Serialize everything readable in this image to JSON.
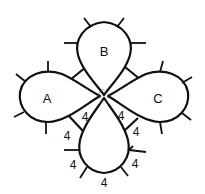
{
  "diagram": {
    "type": "tatting-pattern",
    "rings": [
      {
        "id": "A",
        "label": "A",
        "position": "left"
      },
      {
        "id": "B",
        "label": "B",
        "position": "top"
      },
      {
        "id": "C",
        "label": "C",
        "position": "right"
      },
      {
        "id": "D",
        "label": "",
        "position": "bottom"
      }
    ],
    "stitch_counts": {
      "chain_left_inner": "4",
      "chain_left_outer": "4",
      "chain_right_inner": "4",
      "chain_right_outer": "4",
      "bottom_left_upper": "4",
      "bottom_left_lower": "4",
      "bottom_right_upper": "4",
      "bottom_center": "4"
    },
    "colors": {
      "line": "#111111",
      "background": "#ffffff"
    }
  }
}
